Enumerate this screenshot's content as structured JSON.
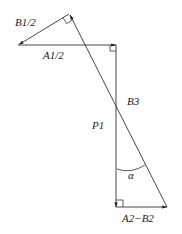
{
  "diagram": {
    "type": "vector-diagram",
    "labels": {
      "b1_half": "B1/2",
      "a1_half": "A1/2",
      "b3": "B3",
      "p1": "P1",
      "alpha": "α",
      "a2_minus_b2": "A2−B2"
    },
    "colors": {
      "line": "#333333",
      "text": "#222222",
      "background": "#ffffff"
    },
    "vectors": [
      {
        "name": "B1/2",
        "from": [
          69,
          14
        ],
        "to": [
          18,
          45
        ]
      },
      {
        "name": "A1/2",
        "from": [
          18,
          45
        ],
        "to": [
          116,
          45
        ]
      },
      {
        "name": "P1",
        "from": [
          116,
          45
        ],
        "to": [
          116,
          207
        ]
      },
      {
        "name": "A2-B2",
        "from": [
          116,
          207
        ],
        "to": [
          167,
          207
        ]
      },
      {
        "name": "B3",
        "from": [
          167,
          207
        ],
        "to": [
          69,
          14
        ]
      }
    ],
    "right_angles": [
      "top-vertex",
      "A1/2-P1 corner",
      "P1-A2B2 corner"
    ],
    "angle": {
      "symbol": "α",
      "between": [
        "P1",
        "B3"
      ]
    }
  }
}
